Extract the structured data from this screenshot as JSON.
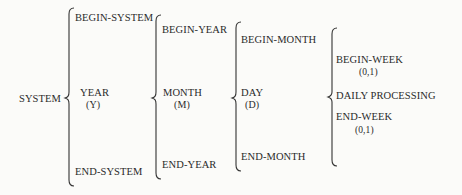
{
  "diagram": {
    "root": {
      "label": "SYSTEM"
    },
    "level1": {
      "begin": "BEGIN-SYSTEM",
      "middle": "YEAR",
      "middle_abbrev": "(Y)",
      "end": "END-SYSTEM"
    },
    "level2": {
      "begin": "BEGIN-YEAR",
      "middle": "MONTH",
      "middle_abbrev": "(M)",
      "end": "END-YEAR"
    },
    "level3": {
      "begin": "BEGIN-MONTH",
      "middle": "DAY",
      "middle_abbrev": "(D)",
      "end": "END-MONTH"
    },
    "level4": {
      "begin": "BEGIN-WEEK",
      "begin_cardinality": "(0,1)",
      "middle": "DAILY PROCESSING",
      "end": "END-WEEK",
      "end_cardinality": "(0,1)"
    },
    "colors": {
      "ink": "#2a2a2a",
      "background": "#fbfbf9"
    }
  }
}
